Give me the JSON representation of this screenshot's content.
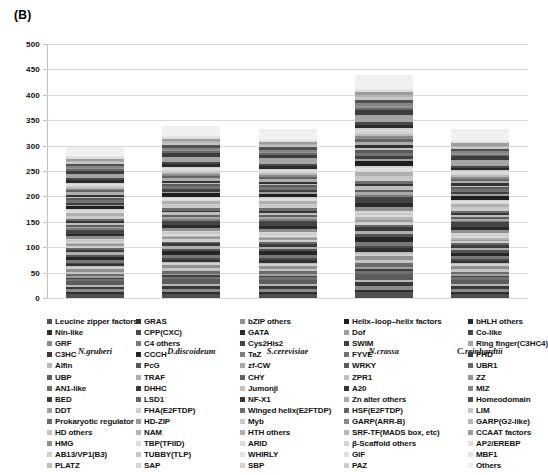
{
  "panel": {
    "label": "(B)"
  },
  "chart_data": {
    "type": "bar",
    "subtype": "stacked-bar",
    "title": "(B)",
    "xlabel": "",
    "ylabel": "",
    "ylim": [
      0,
      500
    ],
    "yticks": [
      0,
      50,
      100,
      150,
      200,
      250,
      300,
      350,
      400,
      450,
      500
    ],
    "grid": true,
    "legend_position": "bottom",
    "grayscale": true,
    "categories": [
      "N.gruberi",
      "D.discoideum",
      "S.cerevisiae",
      "N.crassa",
      "C.reinhardtii"
    ],
    "totals": [
      298,
      340,
      335,
      440,
      333
    ],
    "series": [
      {
        "name": "Leucine zipper factors",
        "color": "#4f4f4f",
        "values": [
          7,
          9,
          8,
          12,
          7
        ]
      },
      {
        "name": "Nin-like",
        "color": "#2e2e2e",
        "values": [
          4,
          5,
          4,
          6,
          4
        ]
      },
      {
        "name": "GRF",
        "color": "#8c8c8c",
        "values": [
          6,
          6,
          5,
          8,
          6
        ]
      },
      {
        "name": "C3HC",
        "color": "#383838",
        "values": [
          5,
          7,
          6,
          9,
          5
        ]
      },
      {
        "name": "Alfin",
        "color": "#b8b8b8",
        "values": [
          3,
          4,
          4,
          5,
          4
        ]
      },
      {
        "name": "UBP",
        "color": "#5c5c5c",
        "values": [
          8,
          10,
          9,
          13,
          8
        ]
      },
      {
        "name": "AN1-like",
        "color": "#707070",
        "values": [
          4,
          5,
          5,
          6,
          4
        ]
      },
      {
        "name": "BED",
        "color": "#3f3f3f",
        "values": [
          3,
          4,
          3,
          5,
          3
        ]
      },
      {
        "name": "DDT",
        "color": "#a0a0a0",
        "values": [
          3,
          3,
          3,
          4,
          3
        ]
      },
      {
        "name": "Prokaryotic regulator",
        "color": "#6b6b6b",
        "values": [
          5,
          7,
          6,
          9,
          5
        ]
      },
      {
        "name": "HD others",
        "color": "#c4c4c4",
        "values": [
          4,
          5,
          4,
          6,
          4
        ]
      },
      {
        "name": "HMG",
        "color": "#909090",
        "values": [
          6,
          7,
          7,
          9,
          6
        ]
      },
      {
        "name": "AB13/VP1(B3)",
        "color": "#d0d0d0",
        "values": [
          3,
          4,
          3,
          5,
          3
        ]
      },
      {
        "name": "PLATZ",
        "color": "#bcbcbc",
        "values": [
          2,
          3,
          3,
          4,
          3
        ]
      },
      {
        "name": "GRAS",
        "color": "#313131",
        "values": [
          4,
          5,
          5,
          7,
          4
        ]
      },
      {
        "name": "CPP(CXC)",
        "color": "#4a4a4a",
        "values": [
          3,
          4,
          4,
          5,
          3
        ]
      },
      {
        "name": "C4 others",
        "color": "#787878",
        "values": [
          5,
          6,
          6,
          8,
          5
        ]
      },
      {
        "name": "CCCH",
        "color": "#262626",
        "values": [
          7,
          9,
          8,
          12,
          7
        ]
      },
      {
        "name": "PcG",
        "color": "#555555",
        "values": [
          4,
          5,
          4,
          6,
          4
        ]
      },
      {
        "name": "TRAF",
        "color": "#aeaeae",
        "values": [
          5,
          6,
          5,
          8,
          5
        ]
      },
      {
        "name": "DHHC",
        "color": "#3b3b3b",
        "values": [
          5,
          6,
          6,
          8,
          5
        ]
      },
      {
        "name": "LSD1",
        "color": "#666666",
        "values": [
          3,
          4,
          4,
          5,
          3
        ]
      },
      {
        "name": "FHA(E2FTDP)",
        "color": "#cfcfcf",
        "values": [
          4,
          5,
          4,
          6,
          4
        ]
      },
      {
        "name": "HD-ZIP",
        "color": "#9a9a9a",
        "values": [
          3,
          4,
          3,
          5,
          3
        ]
      },
      {
        "name": "NAM",
        "color": "#b4b4b4",
        "values": [
          3,
          4,
          3,
          5,
          3
        ]
      },
      {
        "name": "TBP(TFIID)",
        "color": "#dcdcdc",
        "values": [
          2,
          3,
          3,
          4,
          3
        ]
      },
      {
        "name": "TUBBY(TLP)",
        "color": "#c8c8c8",
        "values": [
          3,
          4,
          3,
          5,
          3
        ]
      },
      {
        "name": "SAP",
        "color": "#d6d6d6",
        "values": [
          2,
          3,
          3,
          4,
          3
        ]
      },
      {
        "name": "bZIP others",
        "color": "#8f8f8f",
        "values": [
          6,
          7,
          7,
          9,
          6
        ]
      },
      {
        "name": "GATA",
        "color": "#2b2b2b",
        "values": [
          5,
          6,
          6,
          8,
          5
        ]
      },
      {
        "name": "Cys2His2",
        "color": "#454545",
        "values": [
          8,
          10,
          10,
          14,
          9
        ]
      },
      {
        "name": "TaZ",
        "color": "#7c7c7c",
        "values": [
          3,
          4,
          4,
          5,
          3
        ]
      },
      {
        "name": "zf-CW",
        "color": "#a8a8a8",
        "values": [
          3,
          4,
          3,
          5,
          3
        ]
      },
      {
        "name": "CHY",
        "color": "#5f5f5f",
        "values": [
          4,
          5,
          4,
          6,
          4
        ]
      },
      {
        "name": "Jumonji",
        "color": "#bebebe",
        "values": [
          4,
          5,
          5,
          7,
          4
        ]
      },
      {
        "name": "NF-X1",
        "color": "#353535",
        "values": [
          3,
          4,
          3,
          5,
          3
        ]
      },
      {
        "name": "Winged helix(E2FTDP)",
        "color": "#6e6e6e",
        "values": [
          4,
          5,
          5,
          6,
          4
        ]
      },
      {
        "name": "Myb",
        "color": "#cacaca",
        "values": [
          7,
          9,
          8,
          12,
          8
        ]
      },
      {
        "name": "HTH others",
        "color": "#b0b0b0",
        "values": [
          5,
          6,
          6,
          8,
          5
        ]
      },
      {
        "name": "ARID",
        "color": "#dadada",
        "values": [
          3,
          4,
          3,
          5,
          3
        ]
      },
      {
        "name": "WHIRLY",
        "color": "#e2e2e2",
        "values": [
          2,
          3,
          2,
          4,
          2
        ]
      },
      {
        "name": "SBP",
        "color": "#d2d2d2",
        "values": [
          3,
          3,
          3,
          4,
          3
        ]
      },
      {
        "name": "Helix-loop-helix factors",
        "color": "#1f1f1f",
        "values": [
          6,
          8,
          7,
          11,
          7
        ]
      },
      {
        "name": "Dof",
        "color": "#9e9e9e",
        "values": [
          3,
          4,
          3,
          5,
          3
        ]
      },
      {
        "name": "SWIM",
        "color": "#404040",
        "values": [
          4,
          5,
          4,
          6,
          4
        ]
      },
      {
        "name": "FYVE",
        "color": "#737373",
        "values": [
          5,
          6,
          6,
          8,
          5
        ]
      },
      {
        "name": "WRKY",
        "color": "#5a5a5a",
        "values": [
          4,
          5,
          4,
          6,
          4
        ]
      },
      {
        "name": "ZPR1",
        "color": "#c0c0c0",
        "values": [
          2,
          3,
          3,
          4,
          3
        ]
      },
      {
        "name": "A20",
        "color": "#333333",
        "values": [
          4,
          5,
          4,
          6,
          4
        ]
      },
      {
        "name": "Zn alter others",
        "color": "#adadad",
        "values": [
          5,
          6,
          6,
          8,
          5
        ]
      },
      {
        "name": "HSF(E2FTDP)",
        "color": "#646464",
        "values": [
          4,
          5,
          4,
          6,
          4
        ]
      },
      {
        "name": "GARP(ARR-B)",
        "color": "#8a8a8a",
        "values": [
          3,
          4,
          4,
          5,
          3
        ]
      },
      {
        "name": "SRF-TF(MADS box, etc)",
        "color": "#bbbbbb",
        "values": [
          3,
          4,
          3,
          5,
          3
        ]
      },
      {
        "name": "β-Scaffold others",
        "color": "#d4d4d4",
        "values": [
          4,
          5,
          4,
          6,
          4
        ]
      },
      {
        "name": "GIF",
        "color": "#e0e0e0",
        "values": [
          2,
          3,
          2,
          3,
          2
        ]
      },
      {
        "name": "PAZ",
        "color": "#cdcdcd",
        "values": [
          3,
          3,
          3,
          4,
          3
        ]
      },
      {
        "name": "bHLH others",
        "color": "#2a2a2a",
        "values": [
          5,
          6,
          6,
          8,
          5
        ]
      },
      {
        "name": "Co-like",
        "color": "#484848",
        "values": [
          4,
          5,
          4,
          6,
          4
        ]
      },
      {
        "name": "Ring finger(C3HC4)",
        "color": "#a5a5a5",
        "values": [
          9,
          11,
          11,
          15,
          10
        ]
      },
      {
        "name": "PHD",
        "color": "#3d3d3d",
        "values": [
          6,
          8,
          7,
          10,
          7
        ]
      },
      {
        "name": "UBR1",
        "color": "#696969",
        "values": [
          3,
          4,
          3,
          5,
          3
        ]
      },
      {
        "name": "ZZ",
        "color": "#949494",
        "values": [
          3,
          4,
          3,
          5,
          3
        ]
      },
      {
        "name": "MIZ",
        "color": "#858585",
        "values": [
          3,
          4,
          3,
          5,
          3
        ]
      },
      {
        "name": "Homeodomain",
        "color": "#515151",
        "values": [
          5,
          6,
          6,
          8,
          5
        ]
      },
      {
        "name": "LIM",
        "color": "#c6c6c6",
        "values": [
          3,
          4,
          3,
          5,
          3
        ]
      },
      {
        "name": "GARP(G2-like)",
        "color": "#b6b6b6",
        "values": [
          3,
          4,
          3,
          5,
          3
        ]
      },
      {
        "name": "CCAAT factors",
        "color": "#9c9c9c",
        "values": [
          4,
          5,
          4,
          6,
          4
        ]
      },
      {
        "name": "AP2/EREBP",
        "color": "#dedede",
        "values": [
          3,
          4,
          3,
          5,
          3
        ]
      },
      {
        "name": "MBF1",
        "color": "#e6e6e6",
        "values": [
          2,
          3,
          2,
          3,
          2
        ]
      },
      {
        "name": "Others",
        "color": "#f0f0f0",
        "values": [
          18,
          22,
          22,
          30,
          21
        ]
      }
    ]
  },
  "legend": {
    "columns": [
      {
        "header": "N.gruberi",
        "items": [
          {
            "label": "Leucine zipper factors",
            "color": "#4f4f4f"
          },
          {
            "label": "Nin-like",
            "color": "#2e2e2e"
          },
          {
            "label": "GRF",
            "color": "#8c8c8c"
          },
          {
            "label": "C3HC",
            "color": "#383838"
          },
          {
            "label": "Alfin",
            "color": "#b8b8b8"
          },
          {
            "label": "UBP",
            "color": "#5c5c5c"
          },
          {
            "label": "AN1-like",
            "color": "#707070"
          },
          {
            "label": "BED",
            "color": "#3f3f3f"
          },
          {
            "label": "DDT",
            "color": "#a0a0a0"
          },
          {
            "label": "Prokaryotic regulator",
            "color": "#6b6b6b"
          },
          {
            "label": "HD others",
            "color": "#c4c4c4"
          },
          {
            "label": "HMG",
            "color": "#909090"
          },
          {
            "label": "AB13/VP1(B3)",
            "color": "#d0d0d0"
          },
          {
            "label": "PLATZ",
            "color": "#bcbcbc"
          }
        ]
      },
      {
        "header": "D.discoideum",
        "items": [
          {
            "label": "GRAS",
            "color": "#313131"
          },
          {
            "label": "CPP(CXC)",
            "color": "#4a4a4a"
          },
          {
            "label": "C4 others",
            "color": "#787878"
          },
          {
            "label": "CCCH",
            "color": "#262626"
          },
          {
            "label": "PcG",
            "color": "#555555"
          },
          {
            "label": "TRAF",
            "color": "#aeaeae"
          },
          {
            "label": "DHHC",
            "color": "#3b3b3b"
          },
          {
            "label": "LSD1",
            "color": "#666666"
          },
          {
            "label": "FHA(E2FTDP)",
            "color": "#cfcfcf"
          },
          {
            "label": "HD-ZIP",
            "color": "#9a9a9a"
          },
          {
            "label": "NAM",
            "color": "#b4b4b4"
          },
          {
            "label": "TBP(TFIID)",
            "color": "#dcdcdc"
          },
          {
            "label": "TUBBY(TLP)",
            "color": "#c8c8c8"
          },
          {
            "label": "SAP",
            "color": "#d6d6d6"
          }
        ]
      },
      {
        "header": "S.cerevisiae",
        "items": [
          {
            "label": "bZIP others",
            "color": "#8f8f8f"
          },
          {
            "label": "GATA",
            "color": "#2b2b2b"
          },
          {
            "label": "Cys2His2",
            "color": "#454545"
          },
          {
            "label": "TaZ",
            "color": "#7c7c7c"
          },
          {
            "label": "zf-CW",
            "color": "#a8a8a8"
          },
          {
            "label": "CHY",
            "color": "#5f5f5f"
          },
          {
            "label": "Jumonji",
            "color": "#bebebe"
          },
          {
            "label": "NF-X1",
            "color": "#353535"
          },
          {
            "label": "Winged helix(E2FTDP)",
            "color": "#6e6e6e"
          },
          {
            "label": "Myb",
            "color": "#cacaca"
          },
          {
            "label": "HTH others",
            "color": "#b0b0b0"
          },
          {
            "label": "ARID",
            "color": "#dadada"
          },
          {
            "label": "WHIRLY",
            "color": "#e2e2e2"
          },
          {
            "label": "SBP",
            "color": "#d2d2d2"
          }
        ]
      },
      {
        "header": "N.crassa",
        "items": [
          {
            "label": "Helix–loop–helix factors",
            "color": "#1f1f1f"
          },
          {
            "label": "Dof",
            "color": "#9e9e9e"
          },
          {
            "label": "SWIM",
            "color": "#404040"
          },
          {
            "label": "FYVE",
            "color": "#737373"
          },
          {
            "label": "WRKY",
            "color": "#5a5a5a"
          },
          {
            "label": "ZPR1",
            "color": "#c0c0c0"
          },
          {
            "label": "A20",
            "color": "#333333"
          },
          {
            "label": "Zn alter others",
            "color": "#adadad"
          },
          {
            "label": "HSF(E2FTDP)",
            "color": "#646464"
          },
          {
            "label": "GARP(ARR-B)",
            "color": "#8a8a8a"
          },
          {
            "label": "SRF-TF(MADS box, etc)",
            "color": "#bbbbbb"
          },
          {
            "label": "β-Scaffold others",
            "color": "#d4d4d4"
          },
          {
            "label": "GIF",
            "color": "#e0e0e0"
          },
          {
            "label": "PAZ",
            "color": "#cdcdcd"
          }
        ]
      },
      {
        "header": "C.reinhardtii",
        "items": [
          {
            "label": "bHLH others",
            "color": "#2a2a2a"
          },
          {
            "label": "Co-like",
            "color": "#484848"
          },
          {
            "label": "Ring finger(C3HC4)",
            "color": "#a5a5a5"
          },
          {
            "label": "PHD",
            "color": "#3d3d3d"
          },
          {
            "label": "UBR1",
            "color": "#696969"
          },
          {
            "label": "ZZ",
            "color": "#949494"
          },
          {
            "label": "MIZ",
            "color": "#858585"
          },
          {
            "label": "Homeodomain",
            "color": "#515151"
          },
          {
            "label": "LIM",
            "color": "#c6c6c6"
          },
          {
            "label": "GARP(G2-like)",
            "color": "#b6b6b6"
          },
          {
            "label": "CCAAT factors",
            "color": "#9c9c9c"
          },
          {
            "label": "AP2/EREBP",
            "color": "#dedede"
          },
          {
            "label": "MBF1",
            "color": "#e6e6e6"
          },
          {
            "label": "Others",
            "color": "#f0f0f0"
          }
        ]
      }
    ]
  }
}
